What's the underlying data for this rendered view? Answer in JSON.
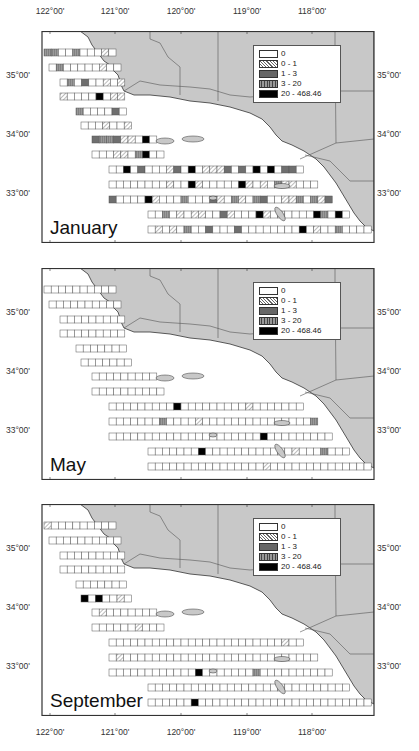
{
  "x_axis": {
    "labels": [
      {
        "text": "122°00'",
        "x": 50
      },
      {
        "text": "121°00'",
        "x": 115
      },
      {
        "text": "120°00'",
        "x": 181
      },
      {
        "text": "119°00'",
        "x": 247
      },
      {
        "text": "118°00'",
        "x": 312
      }
    ]
  },
  "y_axis": {
    "labels": [
      {
        "text": "35°00'",
        "rel_y": 44
      },
      {
        "text": "34°00'",
        "rel_y": 103
      },
      {
        "text": "33°00'",
        "rel_y": 162
      }
    ]
  },
  "legend": {
    "items": [
      {
        "label": "0",
        "pattern": "empty"
      },
      {
        "label": "0 - 1",
        "pattern": "diagonal-hatch"
      },
      {
        "label": "1 - 3",
        "pattern": "dark-crosshatch"
      },
      {
        "label": "3 - 20",
        "pattern": "vertical-grid"
      },
      {
        "label": "20 - 468.46",
        "pattern": "solid-black"
      }
    ]
  },
  "colors": {
    "land": "#c8c8c8",
    "land_border": "#555555",
    "frame": "#333333",
    "cell_border": "#555555",
    "bin_1_3": "#6f6f6f",
    "bin_3_20": "#9a9a9a",
    "bin_20_plus": "#000000"
  },
  "panels": [
    {
      "month": "January",
      "top": 31,
      "density": "high"
    },
    {
      "month": "May",
      "top": 268,
      "density": "low"
    },
    {
      "month": "September",
      "top": 504,
      "density": "low"
    }
  ],
  "chart_data": {
    "type": "heatmap",
    "title": "",
    "xlabel": "Longitude",
    "ylabel": "Latitude",
    "x_ticks": [
      "122°00'",
      "121°00'",
      "120°00'",
      "119°00'",
      "118°00'"
    ],
    "y_ticks": [
      "35°00'",
      "34°00'",
      "33°00'"
    ],
    "legend_bins": [
      "0",
      "0 - 1",
      "1 - 3",
      "3 - 20",
      "20 - 468.46"
    ],
    "panels": [
      "January",
      "May",
      "September"
    ],
    "max_value": 468.46
  }
}
